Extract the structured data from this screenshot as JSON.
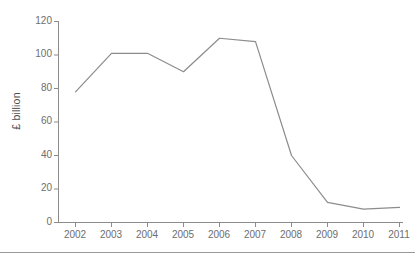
{
  "chart_data": {
    "type": "line",
    "title": "",
    "subtitle": "",
    "xlabel": "",
    "ylabel": "£ billion",
    "categories": [
      "2002",
      "2003",
      "2004",
      "2005",
      "2006",
      "2007",
      "2008",
      "2009",
      "2010",
      "2011"
    ],
    "values": [
      78,
      101,
      101,
      90,
      110,
      108,
      40,
      12,
      8,
      9
    ],
    "series": [
      {
        "name": "£ billion",
        "values": [
          78,
          101,
          101,
          90,
          110,
          108,
          40,
          12,
          8,
          9
        ]
      }
    ],
    "ylim": [
      0,
      120
    ],
    "yticks": [
      0,
      20,
      40,
      60,
      80,
      100,
      120
    ],
    "ytick_labels": [
      "0",
      "20",
      "40",
      "60",
      "80",
      "100",
      "120"
    ],
    "xtick_labels": [
      "2002",
      "2003",
      "2004",
      "2005",
      "2006",
      "2007",
      "2008",
      "2009",
      "2010",
      "2011"
    ],
    "grid": false,
    "legend": false,
    "legend_position": "none",
    "line_color": "#8c8c8c",
    "axis_color": "#8c8c8c",
    "text_color": "#6e6e6e",
    "background_color": "#ffffff"
  },
  "axes": {
    "y_title": "£ billion",
    "y_ticks": [
      {
        "label": "120",
        "value": 120
      },
      {
        "label": "100",
        "value": 100
      },
      {
        "label": "80",
        "value": 80
      },
      {
        "label": "60",
        "value": 60
      },
      {
        "label": "40",
        "value": 40
      },
      {
        "label": "20",
        "value": 20
      },
      {
        "label": "0",
        "value": 0
      }
    ],
    "x_ticks": [
      {
        "label": "2002"
      },
      {
        "label": "2003"
      },
      {
        "label": "2004"
      },
      {
        "label": "2005"
      },
      {
        "label": "2006"
      },
      {
        "label": "2007"
      },
      {
        "label": "2008"
      },
      {
        "label": "2009"
      },
      {
        "label": "2010"
      },
      {
        "label": "2011"
      }
    ]
  }
}
